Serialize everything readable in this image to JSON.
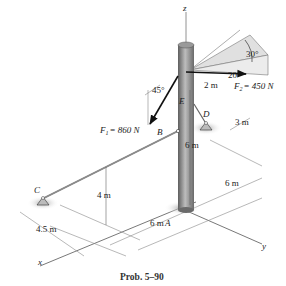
{
  "figure": {
    "caption": "Prob. 5–90",
    "axes": {
      "x": "x",
      "y": "y",
      "z": "z"
    },
    "points": {
      "A": "A",
      "B": "B",
      "C": "C",
      "D": "D",
      "E": "E"
    },
    "forces": {
      "F1": {
        "label": "F",
        "sub": "1",
        "value": "= 860 N",
        "angle": "45°"
      },
      "F2": {
        "label": "F",
        "sub": "2",
        "value": "= 450 N",
        "angle_a": "30°",
        "angle_b": "20°"
      }
    },
    "dimensions": {
      "top_offset": "2 m",
      "pole_height_upper": "6 m",
      "cable_height": "4 m",
      "d_offset": "3 m",
      "y_span": "6 m",
      "x_span": "6 m",
      "c_offset": "4.5 m"
    },
    "colors": {
      "pole_dark": "#6a6a6a",
      "pole_light": "#b8b8b8",
      "line": "#444444",
      "shade": "#d8d8d8"
    }
  }
}
